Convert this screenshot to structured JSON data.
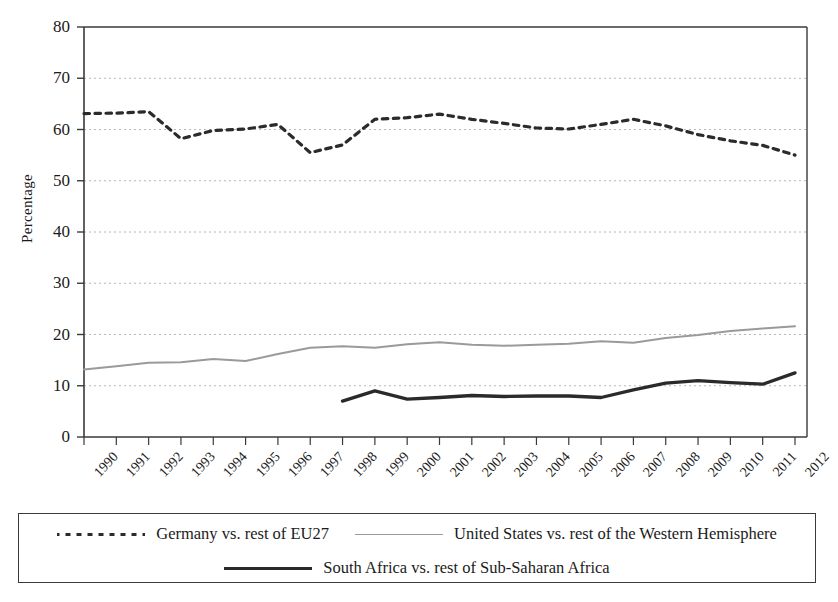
{
  "chart_data": {
    "type": "line",
    "title": "",
    "xlabel": "",
    "ylabel": "Percentage",
    "ylim": [
      0,
      80
    ],
    "ytick_step": 10,
    "yticks": [
      0,
      10,
      20,
      30,
      40,
      50,
      60,
      70,
      80
    ],
    "grid": true,
    "grid_style": "dotted-horizontal",
    "legend_position": "bottom",
    "categories": [
      "1990",
      "1991",
      "1992",
      "1993",
      "1994",
      "1995",
      "1996",
      "1997",
      "1998",
      "1999",
      "2000",
      "2001",
      "2002",
      "2003",
      "2004",
      "2005",
      "2006",
      "2007",
      "2008",
      "2009",
      "2010",
      "2011",
      "2012"
    ],
    "series": [
      {
        "name": "Germany vs. rest of EU27",
        "style": "dotted",
        "color": "#2b2b2b",
        "values": [
          63.1,
          63.2,
          63.5,
          58.2,
          59.8,
          60.1,
          61.0,
          55.5,
          57.0,
          62.0,
          62.3,
          63.0,
          62.0,
          61.2,
          60.3,
          60.1,
          61.0,
          62.0,
          60.7,
          59.0,
          57.8,
          56.9,
          55.0
        ]
      },
      {
        "name": "United States vs. rest of the Western Hemisphere",
        "style": "solid-thin",
        "color": "#9a9a9a",
        "values": [
          13.2,
          13.8,
          14.5,
          14.6,
          15.2,
          14.8,
          16.2,
          17.4,
          17.7,
          17.4,
          18.1,
          18.5,
          18.0,
          17.8,
          18.0,
          18.2,
          18.7,
          18.4,
          19.3,
          19.9,
          20.7,
          21.2,
          21.6
        ]
      },
      {
        "name": "South Africa vs. rest of Sub-Saharan Africa",
        "style": "solid-thick",
        "color": "#2a2a2a",
        "values": [
          null,
          null,
          null,
          null,
          null,
          null,
          null,
          null,
          7.0,
          9.0,
          7.4,
          7.7,
          8.1,
          7.9,
          8.0,
          8.0,
          7.7,
          9.2,
          10.5,
          11.0,
          10.6,
          10.3,
          12.5
        ]
      }
    ]
  },
  "legend": {
    "rows": [
      [
        {
          "label": "Germany vs. rest of EU27",
          "swatch": "dotted"
        },
        {
          "label": "United States vs. rest of the Western Hemisphere",
          "swatch": "gray"
        }
      ],
      [
        {
          "label": "South Africa vs. rest of Sub-Saharan Africa",
          "swatch": "black"
        }
      ]
    ]
  }
}
